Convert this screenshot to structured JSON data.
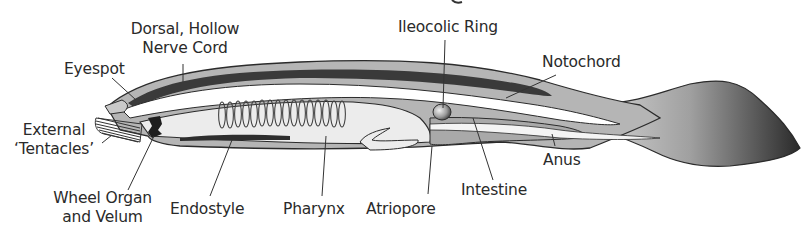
{
  "diagram": {
    "colors": {
      "outline": "#2b2b2b",
      "body_fill": "#b5b5b5",
      "nerve_cord": "#3a3a3a",
      "pharynx_fill": "#ececec",
      "intestine_fill": "#a9a9a9",
      "tail_dark": "#2e2e2e",
      "tail_light": "#c9c9c9",
      "label_text": "#2a2a2a"
    },
    "labels": {
      "dorsal_nerve_cord": {
        "line1": "Dorsal, Hollow",
        "line2": "Nerve Cord"
      },
      "eyespot": "Eyespot",
      "external_tentacles": {
        "line1": "External",
        "line2": "‘Tentacles’"
      },
      "wheel_organ": {
        "line1": "Wheel Organ",
        "line2": "and Velum"
      },
      "endostyle": "Endostyle",
      "pharynx": "Pharynx",
      "atriopore": "Atriopore",
      "intestine": "Intestine",
      "anus": "Anus",
      "ileocolic_ring": "Ileocolic Ring",
      "notochord": "Notochord"
    },
    "gill_slit_count": 16
  }
}
